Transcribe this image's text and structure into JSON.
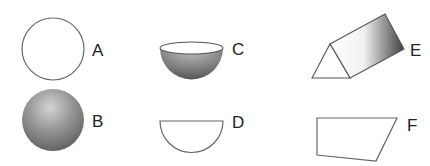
{
  "figure": {
    "shapes": [
      {
        "id": "A",
        "label": "A",
        "kind": "circle outline"
      },
      {
        "id": "B",
        "label": "B",
        "kind": "shaded sphere"
      },
      {
        "id": "C",
        "label": "C",
        "kind": "shaded hemisphere"
      },
      {
        "id": "D",
        "label": "D",
        "kind": "semicircle outline"
      },
      {
        "id": "E",
        "label": "E",
        "kind": "triangular prism"
      },
      {
        "id": "F",
        "label": "F",
        "kind": "quadrilateral outline"
      }
    ],
    "colors": {
      "stroke": "#555555",
      "shade_light": "#d8d8d8",
      "shade_dark": "#5a5a5a",
      "label": "#222222"
    }
  }
}
